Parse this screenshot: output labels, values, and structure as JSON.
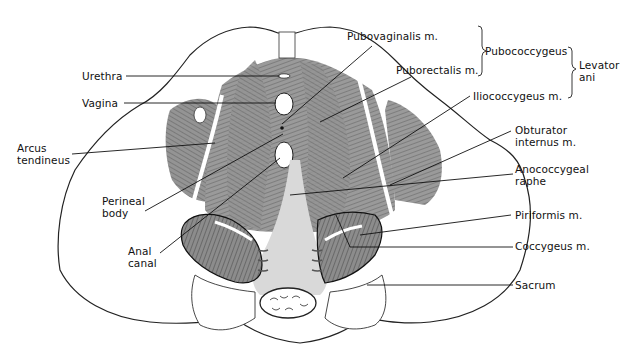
{
  "diagram": {
    "labels_left": [
      {
        "id": "urethra",
        "text": "Urethra"
      },
      {
        "id": "vagina",
        "text": "Vagina"
      },
      {
        "id": "arcus-tendineus",
        "line1": "Arcus",
        "line2": "tendineus"
      },
      {
        "id": "perineal-body",
        "line1": "Perineal",
        "line2": "body"
      },
      {
        "id": "anal-canal",
        "line1": "Anal",
        "line2": "canal"
      }
    ],
    "labels_right": [
      {
        "id": "pubovaginalis",
        "text": "Pubovaginalis m."
      },
      {
        "id": "puborectalis",
        "text": "Puborectalis m."
      },
      {
        "id": "iliococcygeus",
        "text": "Iliococcygeus m."
      },
      {
        "id": "obturator-internus",
        "line1": "Obturator",
        "line2": "internus m."
      },
      {
        "id": "anococcygeal-raphe",
        "line1": "Anococcygeal",
        "line2": "raphe"
      },
      {
        "id": "piriformis",
        "text": "Piriformis m."
      },
      {
        "id": "coccygeus",
        "text": "Coccygeus m."
      },
      {
        "id": "sacrum",
        "text": "Sacrum"
      }
    ],
    "groups": {
      "pubococcygeus": "Pubococcygeus",
      "levator_line1": "Levator",
      "levator_line2": "ani"
    },
    "colors": {
      "muscle": "#8a8a8a",
      "muscle_dark": "#5e5e5e",
      "bone": "#ffffff",
      "outline": "#222222",
      "leader": "#111111"
    }
  }
}
